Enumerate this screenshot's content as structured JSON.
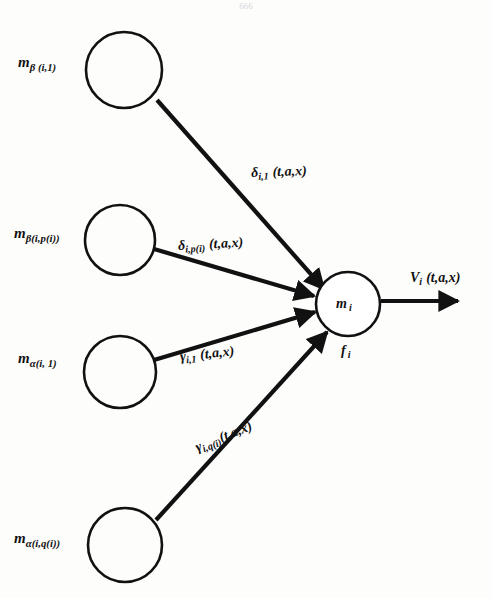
{
  "page": {
    "number": "666",
    "width": 492,
    "height": 598,
    "background_color": "#fdfdfc",
    "ink_color": "#111111"
  },
  "diagram": {
    "type": "neural-unit-signal-flow",
    "title": "",
    "center_node": {
      "name": "center-node",
      "inside_label_symbol": "m",
      "inside_label_subscript": "i",
      "below_label_symbol": "f",
      "below_label_subscript": "i",
      "cx": 348,
      "cy": 304,
      "r": 32
    },
    "input_nodes": [
      {
        "name": "input-node-beta-i-1",
        "label_symbol": "m",
        "label_subscript": "β (i,1)",
        "cx": 124,
        "cy": 70,
        "r": 38,
        "label_x": 18,
        "label_y": 55
      },
      {
        "name": "input-node-beta-i-p-i",
        "label_symbol": "m",
        "label_subscript": "β(i,p(i))",
        "cx": 120,
        "cy": 240,
        "r": 35,
        "label_x": 14,
        "label_y": 226
      },
      {
        "name": "input-node-alpha-i-1",
        "label_symbol": "m",
        "label_subscript": "α(i, 1)",
        "cx": 120,
        "cy": 372,
        "r": 36,
        "label_x": 18,
        "label_y": 351
      },
      {
        "name": "input-node-alpha-i-q-i",
        "label_symbol": "m",
        "label_subscript": "α(i,q(i))",
        "cx": 125,
        "cy": 545,
        "r": 37,
        "label_x": 14,
        "label_y": 531
      }
    ],
    "edges": [
      {
        "name": "edge-delta-i-1",
        "from": "input-node-beta-i-1",
        "to": "center-node",
        "label_symbol": "δ",
        "label_subscript": "i,1",
        "label_args": "(t,a,x)",
        "label_x": 251,
        "label_y": 166,
        "x1": 158,
        "y1": 100,
        "x2": 322,
        "y2": 288
      },
      {
        "name": "edge-delta-i-p-i",
        "from": "input-node-beta-i-p-i",
        "to": "center-node",
        "label_symbol": "δ",
        "label_subscript": "i,p(i)",
        "label_args": "(t,a,x)",
        "label_x": 178,
        "label_y": 239,
        "x1": 155,
        "y1": 248,
        "x2": 313,
        "y2": 295
      },
      {
        "name": "edge-gamma-i-1",
        "from": "input-node-alpha-i-1",
        "to": "center-node",
        "label_symbol": "γ",
        "label_subscript": "i,1",
        "label_args": "(t,a,x)",
        "label_x": 180,
        "label_y": 350,
        "x1": 155,
        "y1": 360,
        "x2": 314,
        "y2": 312
      },
      {
        "name": "edge-gamma-i-q-i",
        "from": "input-node-alpha-i-q-i",
        "to": "center-node",
        "label_symbol": "γ",
        "label_subscript": "i,q(i)",
        "label_args": "(t,a,x)",
        "label_x": 196,
        "label_y": 441,
        "x1": 157,
        "y1": 519,
        "x2": 325,
        "y2": 331
      },
      {
        "name": "edge-output-v-i",
        "from": "center-node",
        "to": "output",
        "label_symbol": "V",
        "label_subscript": "i",
        "label_args": "(t,a,x)",
        "label_x": 410,
        "label_y": 271,
        "x1": 381,
        "y1": 301,
        "x2": 460,
        "y2": 301
      }
    ]
  }
}
